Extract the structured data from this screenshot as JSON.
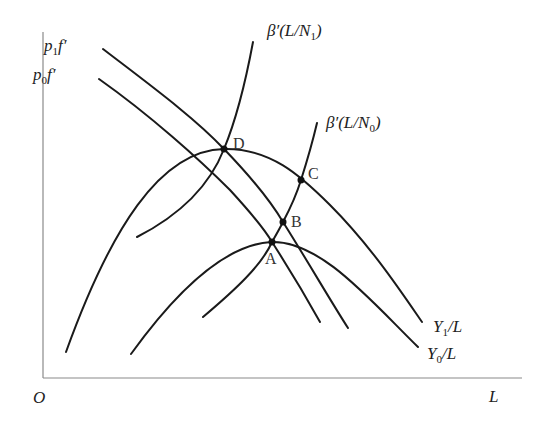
{
  "diagram": {
    "axes": {
      "origin": "O",
      "x_axis": "L"
    },
    "curves": {
      "p1f": {
        "base": "p",
        "sub": "1",
        "tail": "f′"
      },
      "p0f": {
        "base": "p",
        "sub": "0",
        "tail": "f′"
      },
      "beta_n1": {
        "head": "β′(L/N",
        "sub": "1",
        "tail": ")"
      },
      "beta_n0": {
        "head": "β′(L/N",
        "sub": "0",
        "tail": ")"
      },
      "y1": {
        "head": "Y",
        "sub": "1",
        "tail": "/L"
      },
      "y0": {
        "head": "Y",
        "sub": "0",
        "tail": "/L"
      }
    },
    "points": {
      "A": "A",
      "B": "B",
      "C": "C",
      "D": "D"
    }
  }
}
